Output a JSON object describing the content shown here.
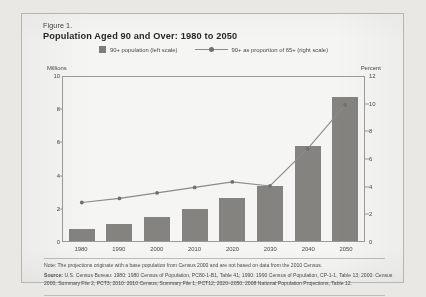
{
  "figure": {
    "number_label": "Figure 1.",
    "title": "Population Aged 90 and Over: 1980 to 2050"
  },
  "legend": {
    "bar_label": "90+ population (left scale)",
    "line_label": "90+ as proportion of 65+ (right scale)"
  },
  "axes": {
    "left_unit_label": "Millions",
    "right_unit_label": "Percent"
  },
  "notes": {
    "note": "Note: The projections originate with a base population from Census 2000 and are not based on data from the 2010 Census.",
    "source_prefix": "Source:",
    "source_body": "U.S. Census Bureau: 1980: 1980 Census of Population, PC80-1-B1, Table 41; 1990: 1990 Census of Population, CP-1-1, Table 13; 2000: Census 2000, Summary File 2, PCT3; 2010: 2010 Census, Summary File 1, PCT12; 2020–2050: 2008 National Population Projections, Table 12."
  },
  "colors": {
    "bar_fill": "#807e7a",
    "line_stroke": "#8c8a86",
    "marker_fill": "#6f6d69",
    "axis": "#9d9b97",
    "paper": "#fbfbf9",
    "text": "#3c3a38"
  },
  "chart_data": {
    "type": "bar",
    "title": "Population Aged 90 and Over: 1980 to 2050",
    "xlabel": "",
    "ylabel": "Millions",
    "y2label": "Percent",
    "categories": [
      "1980",
      "1990",
      "2000",
      "2010",
      "2020",
      "2030",
      "2040",
      "2050"
    ],
    "ylim": [
      0,
      10
    ],
    "y2lim": [
      0,
      12
    ],
    "yticks": [
      0,
      2,
      4,
      6,
      8,
      10
    ],
    "y2ticks": [
      0,
      2,
      4,
      6,
      8,
      10,
      12
    ],
    "grid": false,
    "legend_position": "top-center",
    "series": [
      {
        "name": "90+ population (left scale)",
        "type": "bar",
        "axis": "left",
        "unit": "millions",
        "values": [
          0.7,
          1.0,
          1.45,
          1.9,
          2.6,
          3.3,
          5.7,
          8.7
        ]
      },
      {
        "name": "90+ as proportion of 65+ (right scale)",
        "type": "line",
        "axis": "right",
        "unit": "percent",
        "values": [
          2.8,
          3.1,
          3.5,
          3.9,
          4.3,
          4.0,
          6.7,
          9.9
        ]
      }
    ]
  }
}
